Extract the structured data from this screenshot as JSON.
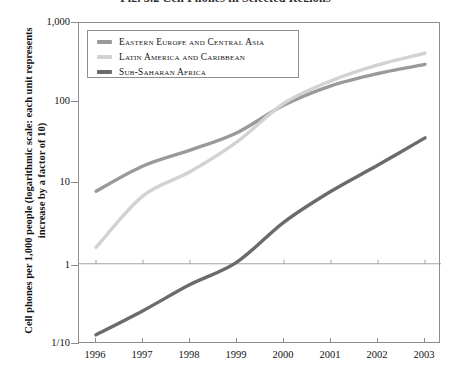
{
  "title": "Fig. 3.2  Cell Phones in Selected Regions",
  "axis": {
    "y_title": "Cell phones per 1,000 people (logarithmic scale: each unit represents increase by a factor of 10)",
    "y_ticks": [
      "1,000",
      "100",
      "10",
      "1",
      "1/10"
    ],
    "x_ticks": [
      "1996",
      "1997",
      "1998",
      "1999",
      "2000",
      "2001",
      "2002",
      "2003"
    ]
  },
  "legend": {
    "items": [
      {
        "label": "Eastern Europe and Central Asia",
        "color": "#9a9a9a"
      },
      {
        "label": "Latin America and Caribbean",
        "color": "#d2d2d2"
      },
      {
        "label": "Sub-Saharan Africa",
        "color": "#6b6b6b"
      }
    ]
  },
  "chart_data": {
    "type": "line",
    "title": "Fig. 3.2  Cell Phones in Selected Regions",
    "xlabel": "",
    "ylabel": "Cell phones per 1,000 people (logarithmic scale: each unit represents increase by a factor of 10)",
    "x": [
      1996,
      1997,
      1998,
      1999,
      2000,
      2001,
      2002,
      2003
    ],
    "yscale": "log",
    "ylim": [
      0.1,
      1000
    ],
    "ytick_values": [
      1000,
      100,
      10,
      1,
      0.1
    ],
    "grid": "y=1 reference line only",
    "legend_position": "inside top-left",
    "series": [
      {
        "name": "Eastern Europe and Central Asia",
        "color": "#9a9a9a",
        "values": [
          8.0,
          16.5,
          26.0,
          43.0,
          95.0,
          165.0,
          235.0,
          305.0
        ]
      },
      {
        "name": "Latin America and Caribbean",
        "color": "#d2d2d2",
        "values": [
          1.6,
          7.0,
          14.0,
          33.0,
          100.0,
          190.0,
          300.0,
          420.0
        ]
      },
      {
        "name": "Sub-Saharan Africa",
        "color": "#6b6b6b",
        "values": [
          0.13,
          0.26,
          0.55,
          1.05,
          3.3,
          8.0,
          17.0,
          37.0
        ]
      }
    ]
  }
}
